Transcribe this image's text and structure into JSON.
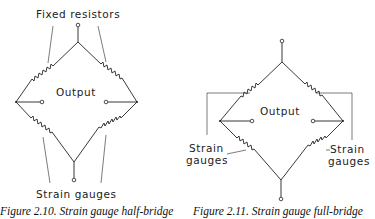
{
  "figures": [
    {
      "id": "half-bridge",
      "top_label": "Fixed resistors",
      "output_label": "Output",
      "bottom_label": "Strain gauges",
      "caption": "Figure 2.10. Strain gauge half-bridge"
    },
    {
      "id": "full-bridge",
      "output_label": "Output",
      "left_label_line1": "Strain",
      "left_label_line2": "gauges",
      "right_label_line1": "Strain",
      "right_label_line2": "gauges",
      "caption": "Figure 2.11. Strain gauge full-bridge"
    }
  ]
}
